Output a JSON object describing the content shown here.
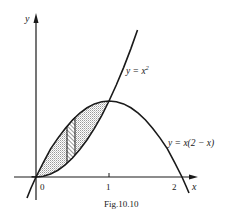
{
  "figure": {
    "caption": "Fig.10.10",
    "axes": {
      "x_label": "x",
      "y_label": "y",
      "ticks": [
        {
          "value": 0,
          "label": "0"
        },
        {
          "value": 1,
          "label": "1"
        },
        {
          "value": 2,
          "label": "2"
        }
      ]
    },
    "curves": [
      {
        "name": "parabola-up",
        "label": "y = x",
        "exponent": "2",
        "equation": "y = x^2"
      },
      {
        "name": "parabola-down",
        "label": "y = x(2 − x)",
        "equation": "y = x(2 - x)"
      }
    ],
    "shaded_region": {
      "description": "region between y = x^2 and y = x(2-x) for 0 ≤ x ≤ 1",
      "fill": "dotted grey"
    },
    "strip": {
      "description": "vertical hatched element strip",
      "x_approx": [
        0.42,
        0.54
      ]
    },
    "colors": {
      "ink": "#1a1a1a",
      "shade": "#bdbdbd",
      "background": "#ffffff"
    }
  }
}
